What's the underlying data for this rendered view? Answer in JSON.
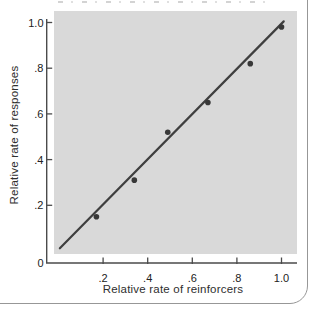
{
  "panel": {
    "background": "#ffffff",
    "border_color": "#979797"
  },
  "chart_data": {
    "type": "scatter",
    "title": "",
    "xlabel": "Relative rate of reinforcers",
    "ylabel": "Relative rate of responses",
    "xlim": [
      0,
      1.05
    ],
    "ylim": [
      0,
      1.05
    ],
    "grid": false,
    "legend": null,
    "plot_background": "#d9d9d9",
    "axis_color": "#4b4b4b",
    "tick_label_color": "#222222",
    "point_color": "#383838",
    "line_color": "#3f3f3f",
    "origin_label": "0",
    "x_ticks": [
      {
        "value": 0.2,
        "label": ".2"
      },
      {
        "value": 0.4,
        "label": ".4"
      },
      {
        "value": 0.6,
        "label": ".6"
      },
      {
        "value": 0.8,
        "label": ".8"
      },
      {
        "value": 1.0,
        "label": "1.0"
      }
    ],
    "y_ticks": [
      {
        "value": 0.2,
        "label": ".2"
      },
      {
        "value": 0.4,
        "label": ".4"
      },
      {
        "value": 0.6,
        "label": ".6"
      },
      {
        "value": 0.8,
        "label": ".8"
      },
      {
        "value": 1.0,
        "label": "1.0"
      }
    ],
    "points": [
      {
        "x": 0.17,
        "y": 0.15
      },
      {
        "x": 0.34,
        "y": 0.31
      },
      {
        "x": 0.49,
        "y": 0.52
      },
      {
        "x": 0.67,
        "y": 0.65
      },
      {
        "x": 0.86,
        "y": 0.82
      },
      {
        "x": 1.0,
        "y": 0.98
      }
    ],
    "fit_line": {
      "x1": 0.006,
      "y1": 0.012,
      "x2": 1.01,
      "y2": 1.005
    }
  }
}
